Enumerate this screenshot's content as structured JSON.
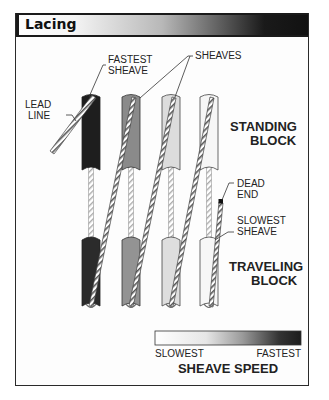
{
  "title": "Lacing",
  "labels": {
    "fastest_sheave_1": "FASTEST",
    "fastest_sheave_2": "SHEAVE",
    "sheaves": "SHEAVES",
    "lead_line_1": "LEAD",
    "lead_line_2": "LINE",
    "standing_block_1": "STANDING",
    "standing_block_2": "BLOCK",
    "dead_end_1": "DEAD",
    "dead_end_2": "END",
    "slowest_sheave_1": "SLOWEST",
    "slowest_sheave_2": "SHEAVE",
    "traveling_block_1": "TRAVELING",
    "traveling_block_2": "BLOCK"
  },
  "legend": {
    "title": "SHEAVE SPEED",
    "min_label": "SLOWEST",
    "max_label": "FASTEST",
    "gradient_start": "#ffffff",
    "gradient_end": "#1c1c1c"
  },
  "sheaves": {
    "colors": [
      "#1e1e1e",
      "#8a8a8a",
      "#dcdcdc",
      "#f6f6f6"
    ],
    "speed_order": [
      "fastest",
      "fast",
      "slow",
      "slowest"
    ]
  }
}
